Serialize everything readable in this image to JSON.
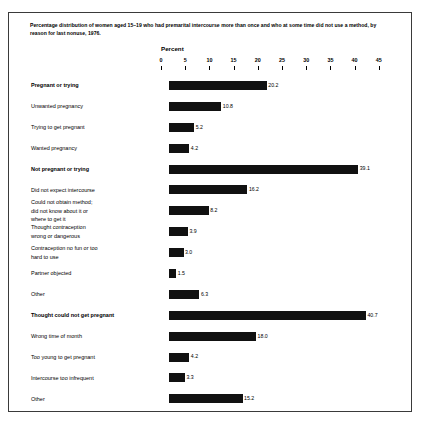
{
  "figure": {
    "title": "Percentage distribution of women aged 15–19 who had premarital intercourse more than once and who at some time did not use a method, by reason for last nonuse, 1976.",
    "axis_title": "Percent",
    "border_color": "#3a3a3a",
    "bar_color": "#111111"
  },
  "chart_data": {
    "type": "bar",
    "orientation": "horizontal",
    "title": "Percentage distribution of women aged 15–19 who had premarital intercourse more than once and who at some time did not use a method, by reason for last nonuse, 1976.",
    "xlabel": "Percent",
    "ylabel": "",
    "xlim": [
      0,
      45
    ],
    "xticks": [
      0,
      5,
      10,
      15,
      20,
      25,
      30,
      35,
      40,
      45
    ],
    "xtick_labels": [
      "0",
      "5",
      "10",
      "15",
      "20",
      "25",
      "30",
      "35",
      "40",
      "45"
    ],
    "grid": false,
    "legend": false,
    "categories": [
      "Pregnant or trying",
      "Unwanted pregnancy",
      "Trying to get pregnant",
      "Wanted pregnancy",
      "Not pregnant or trying",
      "Did not expect intercourse",
      "Could not obtain method;\ndid not know about it or\nwhere to get it",
      "Thought contraception\nwrong or dangerous",
      "Contraception no fun or too\nhard to use",
      "Partner objected",
      "Other",
      "Thought could not get pregnant",
      "Wrong time of month",
      "Too young to get pregnant",
      "Intercourse too infrequent",
      "Other"
    ],
    "values": [
      20.2,
      10.8,
      5.2,
      4.2,
      39.1,
      16.2,
      8.2,
      3.9,
      3.0,
      1.5,
      6.3,
      40.7,
      18.0,
      4.2,
      3.3,
      15.2
    ],
    "value_labels": [
      "20.2",
      "10.8",
      "5.2",
      "4.2",
      "39.1",
      "16.2",
      "8.2",
      "3.9",
      "3.0",
      "1.5",
      "6.3",
      "40.7",
      "18.0",
      "4.2",
      "3.3",
      "15.2"
    ],
    "bold_categories": [
      "Pregnant or trying",
      "Not pregnant or trying",
      "Thought could not get pregnant"
    ]
  },
  "rows": [
    {
      "label": "Pregnant or trying",
      "value": "20.2",
      "num": 20.2,
      "bold": true,
      "indent": false
    },
    {
      "label": "Unwanted pregnancy",
      "value": "10.8",
      "num": 10.8,
      "bold": false,
      "indent": false
    },
    {
      "label": "Trying to get pregnant",
      "value": "5.2",
      "num": 5.2,
      "bold": false,
      "indent": false
    },
    {
      "label": "Wanted pregnancy",
      "value": "4.2",
      "num": 4.2,
      "bold": false,
      "indent": false
    },
    {
      "label": "Not pregnant or trying",
      "value": "39.1",
      "num": 39.1,
      "bold": true,
      "indent": false
    },
    {
      "label": "Did not expect intercourse",
      "value": "16.2",
      "num": 16.2,
      "bold": false,
      "indent": false
    },
    {
      "label": "Could not obtain method;\n   did not know about it or\n   where to get it",
      "value": "8.2",
      "num": 8.2,
      "bold": false,
      "indent": false
    },
    {
      "label": "Thought contraception\n   wrong or dangerous",
      "value": "3.9",
      "num": 3.9,
      "bold": false,
      "indent": true
    },
    {
      "label": "Contraception no fun or too\n   hard to use",
      "value": "3.0",
      "num": 3.0,
      "bold": false,
      "indent": false
    },
    {
      "label": "Partner objected",
      "value": "1.5",
      "num": 1.5,
      "bold": false,
      "indent": false
    },
    {
      "label": "Other",
      "value": "6.3",
      "num": 6.3,
      "bold": false,
      "indent": false
    },
    {
      "label": "Thought could not get pregnant",
      "value": "40.7",
      "num": 40.7,
      "bold": true,
      "indent": false
    },
    {
      "label": "Wrong time of month",
      "value": "18.0",
      "num": 18.0,
      "bold": false,
      "indent": false
    },
    {
      "label": "Too young to get pregnant",
      "value": "4.2",
      "num": 4.2,
      "bold": false,
      "indent": false
    },
    {
      "label": "Intercourse too infrequent",
      "value": "3.3",
      "num": 3.3,
      "bold": false,
      "indent": false
    },
    {
      "label": "Other",
      "value": "15.2",
      "num": 15.2,
      "bold": false,
      "indent": false
    }
  ]
}
